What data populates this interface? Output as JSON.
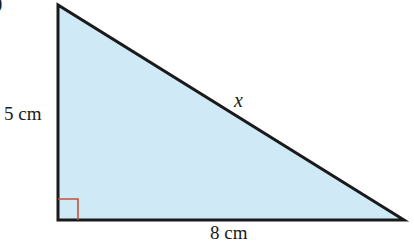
{
  "diagram": {
    "type": "right-triangle",
    "part_label": ")",
    "vertices": {
      "top": [
        58,
        5
      ],
      "bottom_left": [
        58,
        220
      ],
      "bottom_right": [
        404,
        220
      ]
    },
    "fill_color": "#cfe9f6",
    "stroke_color": "#1a1a1a",
    "right_angle_marker_color": "#c0533a",
    "labels": {
      "vertical_side": "5 cm",
      "horizontal_side": "8 cm",
      "hypotenuse": "x"
    }
  }
}
